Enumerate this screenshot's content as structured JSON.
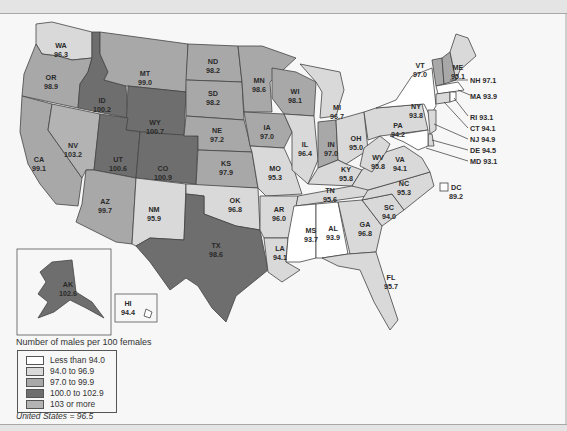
{
  "legend": {
    "title": "Number of males per 100 females",
    "items": [
      {
        "label": "Less than 94.0",
        "color": "#ffffff"
      },
      {
        "label": "94.0 to 96.9",
        "color": "#d9d9d9"
      },
      {
        "label": "97.0 to 99.9",
        "color": "#a8a8a8"
      },
      {
        "label": "100.0 to 102.9",
        "color": "#6e6e6e"
      },
      {
        "label": "103 or more",
        "color": "#b3b3b3"
      }
    ]
  },
  "us_note": "United States = 96.5",
  "states": {
    "WA": {
      "abbr": "WA",
      "value": "96.3"
    },
    "OR": {
      "abbr": "OR",
      "value": "98.9"
    },
    "CA": {
      "abbr": "CA",
      "value": "99.1"
    },
    "ID": {
      "abbr": "ID",
      "value": "100.2"
    },
    "NV": {
      "abbr": "NV",
      "value": "103.2"
    },
    "MT": {
      "abbr": "MT",
      "value": "99.0"
    },
    "WY": {
      "abbr": "WY",
      "value": "100.7"
    },
    "UT": {
      "abbr": "UT",
      "value": "100.6"
    },
    "CO": {
      "abbr": "CO",
      "value": "100.9"
    },
    "AZ": {
      "abbr": "AZ",
      "value": "99.7"
    },
    "NM": {
      "abbr": "NM",
      "value": "95.9"
    },
    "ND": {
      "abbr": "ND",
      "value": "98.2"
    },
    "SD": {
      "abbr": "SD",
      "value": "98.2"
    },
    "NE": {
      "abbr": "NE",
      "value": "97.2"
    },
    "KS": {
      "abbr": "KS",
      "value": "97.9"
    },
    "OK": {
      "abbr": "OK",
      "value": "96.8"
    },
    "TX": {
      "abbr": "TX",
      "value": "98.6"
    },
    "MN": {
      "abbr": "MN",
      "value": "98.6"
    },
    "IA": {
      "abbr": "IA",
      "value": "97.0"
    },
    "MO": {
      "abbr": "MO",
      "value": "95.3"
    },
    "AR": {
      "abbr": "AR",
      "value": "96.0"
    },
    "LA": {
      "abbr": "LA",
      "value": "94.1"
    },
    "WI": {
      "abbr": "WI",
      "value": "98.1"
    },
    "IL": {
      "abbr": "IL",
      "value": "96.4"
    },
    "MI": {
      "abbr": "MI",
      "value": "96.7"
    },
    "IN": {
      "abbr": "IN",
      "value": "97.0"
    },
    "OH": {
      "abbr": "OH",
      "value": "95.0"
    },
    "KY": {
      "abbr": "KY",
      "value": "95.8"
    },
    "TN": {
      "abbr": "TN",
      "value": "95.6"
    },
    "MS": {
      "abbr": "MS",
      "value": "93.7"
    },
    "AL": {
      "abbr": "AL",
      "value": "93.9"
    },
    "GA": {
      "abbr": "GA",
      "value": "96.8"
    },
    "FL": {
      "abbr": "FL",
      "value": "95.7"
    },
    "SC": {
      "abbr": "SC",
      "value": "94.0"
    },
    "NC": {
      "abbr": "NC",
      "value": "95.3"
    },
    "VA": {
      "abbr": "VA",
      "value": "94.1"
    },
    "WV": {
      "abbr": "WV",
      "value": "95.8"
    },
    "PA": {
      "abbr": "PA",
      "value": "94.2"
    },
    "NY": {
      "abbr": "NY",
      "value": "93.8"
    },
    "VT": {
      "abbr": "VT",
      "value": "97.0"
    },
    "ME": {
      "abbr": "ME",
      "value": "95.1"
    },
    "AK": {
      "abbr": "AK",
      "value": "102.6"
    },
    "HI": {
      "abbr": "HI",
      "value": "94.4"
    }
  },
  "callouts": {
    "NH": "NH 97.1",
    "MA": "MA 93.9",
    "RI": "RI 93.1",
    "CT": "CT 94.1",
    "NJ": "NJ 94.9",
    "DE": "DE 94.5",
    "MD": "MD 93.1"
  },
  "dc": {
    "abbr": "DC",
    "value": "89.2"
  }
}
